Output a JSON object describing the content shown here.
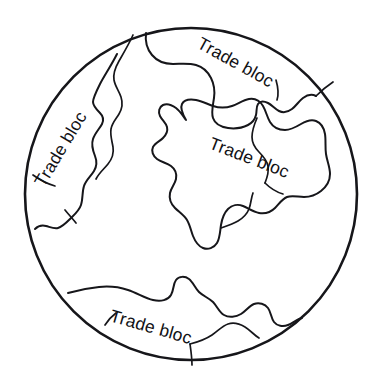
{
  "figure": {
    "kind": "globe-trade-bloc-diagram",
    "background_color": "#ffffff",
    "line_color": "#16161a",
    "text_color": "#111114",
    "width": 379,
    "height": 389
  },
  "globe": {
    "name": "globe-circle",
    "center_x": 191,
    "center_y": 194,
    "radius": 166
  },
  "blocs": [
    {
      "id": "bloc-west",
      "label": "Trade bloc",
      "position": "left",
      "text_x": 44,
      "text_y": 188,
      "rotation_deg": -59
    },
    {
      "id": "bloc-northeast",
      "label": "Trade bloc",
      "position": "top-right",
      "text_x": 196,
      "text_y": 47,
      "rotation_deg": 29
    },
    {
      "id": "bloc-central",
      "label": "Trade bloc",
      "position": "center-right",
      "text_x": 208,
      "text_y": 148,
      "rotation_deg": 21
    },
    {
      "id": "bloc-south",
      "label": "Trade bloc",
      "position": "bottom",
      "text_x": 109,
      "text_y": 321,
      "rotation_deg": 16
    }
  ]
}
